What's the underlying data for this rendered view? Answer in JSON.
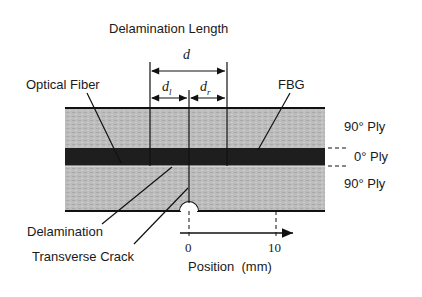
{
  "title": "Delamination Length",
  "dimensions": {
    "total": "d",
    "left": "d",
    "left_sub": "l",
    "right": "d",
    "right_sub": "r"
  },
  "callouts": {
    "optical_fiber": "Optical Fiber",
    "fbg": "FBG",
    "delamination": "Delamination",
    "transverse_crack": "Transverse Crack"
  },
  "layers": [
    {
      "label": "90° Ply",
      "position": "top"
    },
    {
      "label": "0° Ply",
      "position": "middle"
    },
    {
      "label": "90° Ply",
      "position": "bottom"
    }
  ],
  "axis": {
    "label": "Position  (mm)",
    "ticks": [
      "0",
      "10"
    ]
  },
  "colors": {
    "ply90": "#b9b9b9",
    "ply0": "#1e1e1e",
    "lines": "#111111"
  }
}
